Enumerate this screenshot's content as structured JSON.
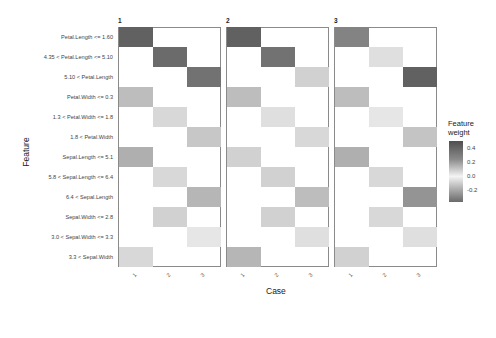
{
  "chart_data": {
    "type": "heatmap",
    "title": "",
    "xlabel": "Case",
    "ylabel": "Feature",
    "facets": [
      "1",
      "2",
      "3"
    ],
    "x_categories": [
      "1",
      "2",
      "3"
    ],
    "features": [
      "Petal.Length <= 1.60",
      "4.35 < Petal.Length <= 5.10",
      "5.10 < Petal.Length",
      "Petal.Width <= 0.3",
      "1.3 < Petal.Width <= 1.8",
      "1.8 < Petal.Width",
      "Sepal.Length <= 5.1",
      "5.8 < Sepal.Length <= 6.4",
      "6.4 < Sepal.Length",
      "Sepal.Width <= 2.8",
      "3.0 < Sepal.Width <= 3.3",
      "3.3 < Sepal.Width"
    ],
    "legend": {
      "title": "Feature weight",
      "ticks": [
        "0.4",
        "0.2",
        "0.0",
        "-0.2"
      ],
      "range": [
        -0.3,
        0.5
      ]
    },
    "cells": [
      {
        "facet": "1",
        "case": "1",
        "feature": 0,
        "weight": 0.45
      },
      {
        "facet": "1",
        "case": "2",
        "feature": 1,
        "weight": 0.42
      },
      {
        "facet": "1",
        "case": "3",
        "feature": 2,
        "weight": 0.4
      },
      {
        "facet": "1",
        "case": "1",
        "feature": 3,
        "weight": 0.18
      },
      {
        "facet": "1",
        "case": "2",
        "feature": 4,
        "weight": 0.1
      },
      {
        "facet": "1",
        "case": "3",
        "feature": 5,
        "weight": 0.15
      },
      {
        "facet": "1",
        "case": "1",
        "feature": 6,
        "weight": 0.22
      },
      {
        "facet": "1",
        "case": "2",
        "feature": 7,
        "weight": 0.1
      },
      {
        "facet": "1",
        "case": "3",
        "feature": 8,
        "weight": 0.2
      },
      {
        "facet": "1",
        "case": "2",
        "feature": 9,
        "weight": 0.12
      },
      {
        "facet": "1",
        "case": "3",
        "feature": 10,
        "weight": 0.06
      },
      {
        "facet": "1",
        "case": "1",
        "feature": 11,
        "weight": 0.1
      },
      {
        "facet": "2",
        "case": "1",
        "feature": 0,
        "weight": 0.45
      },
      {
        "facet": "2",
        "case": "2",
        "feature": 1,
        "weight": 0.4
      },
      {
        "facet": "2",
        "case": "3",
        "feature": 2,
        "weight": 0.12
      },
      {
        "facet": "2",
        "case": "1",
        "feature": 3,
        "weight": 0.18
      },
      {
        "facet": "2",
        "case": "2",
        "feature": 4,
        "weight": 0.08
      },
      {
        "facet": "2",
        "case": "3",
        "feature": 5,
        "weight": 0.1
      },
      {
        "facet": "2",
        "case": "1",
        "feature": 6,
        "weight": 0.12
      },
      {
        "facet": "2",
        "case": "2",
        "feature": 7,
        "weight": 0.12
      },
      {
        "facet": "2",
        "case": "3",
        "feature": 8,
        "weight": 0.18
      },
      {
        "facet": "2",
        "case": "2",
        "feature": 9,
        "weight": 0.12
      },
      {
        "facet": "2",
        "case": "3",
        "feature": 10,
        "weight": 0.08
      },
      {
        "facet": "2",
        "case": "1",
        "feature": 11,
        "weight": 0.2
      },
      {
        "facet": "3",
        "case": "1",
        "feature": 0,
        "weight": 0.35
      },
      {
        "facet": "3",
        "case": "2",
        "feature": 1,
        "weight": 0.08
      },
      {
        "facet": "3",
        "case": "3",
        "feature": 2,
        "weight": 0.45
      },
      {
        "facet": "3",
        "case": "1",
        "feature": 3,
        "weight": 0.18
      },
      {
        "facet": "3",
        "case": "2",
        "feature": 4,
        "weight": 0.06
      },
      {
        "facet": "3",
        "case": "3",
        "feature": 5,
        "weight": 0.16
      },
      {
        "facet": "3",
        "case": "1",
        "feature": 6,
        "weight": 0.22
      },
      {
        "facet": "3",
        "case": "2",
        "feature": 7,
        "weight": 0.1
      },
      {
        "facet": "3",
        "case": "3",
        "feature": 8,
        "weight": 0.3
      },
      {
        "facet": "3",
        "case": "2",
        "feature": 9,
        "weight": 0.1
      },
      {
        "facet": "3",
        "case": "3",
        "feature": 10,
        "weight": 0.08
      },
      {
        "facet": "3",
        "case": "1",
        "feature": 11,
        "weight": 0.12
      }
    ],
    "grid": false,
    "legend_position": "right"
  }
}
